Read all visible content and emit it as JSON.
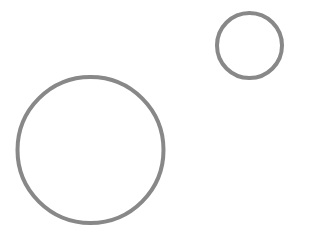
{
  "canvas": {
    "width": 325,
    "height": 237,
    "background": "#ffffff"
  },
  "shapes": [
    {
      "type": "circle",
      "label": "large-circle",
      "cx": 90.5,
      "cy": 150,
      "r": 73,
      "stroke": "#888888",
      "stroke_width": 4,
      "fill": "none"
    },
    {
      "type": "circle",
      "label": "small-circle",
      "cx": 249.5,
      "cy": 45.5,
      "r": 32.5,
      "stroke": "#888888",
      "stroke_width": 4,
      "fill": "none"
    }
  ]
}
